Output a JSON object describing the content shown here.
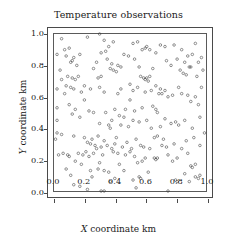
{
  "chart_data": {
    "type": "scatter",
    "title": "Temperature observations",
    "xlabel_var": "X",
    "xlabel_rest": " coordinate km",
    "ylabel_var": "Y",
    "ylabel_rest": " coordinate km",
    "xlim": [
      0.0,
      1.0
    ],
    "ylim": [
      0.0,
      1.0
    ],
    "grid": false,
    "legend": null,
    "marker": "open-circle",
    "marker_color": "#3a3a3a",
    "marker_size_px": 2.6,
    "xticks": [
      0.0,
      0.2,
      0.4,
      0.6,
      0.8,
      1.0
    ],
    "xticklabels": [
      "0.0",
      "0.2",
      "0.4",
      "0.6",
      "0.8",
      "1.0"
    ],
    "yticks": [
      0.0,
      0.2,
      0.4,
      0.6,
      0.8,
      1.0
    ],
    "yticklabels": [
      "0.0",
      "0.2",
      "0.4",
      "0.6",
      "0.8",
      "1.0"
    ],
    "n_points": 228,
    "points": [
      [
        0.3,
        1.0
      ],
      [
        0.05,
        0.97
      ],
      [
        0.22,
        0.98
      ],
      [
        0.33,
        0.96
      ],
      [
        0.39,
        0.95
      ],
      [
        0.52,
        0.94
      ],
      [
        0.55,
        0.95
      ],
      [
        0.93,
        0.94
      ],
      [
        0.1,
        0.91
      ],
      [
        0.36,
        0.92
      ],
      [
        0.61,
        0.92
      ],
      [
        0.7,
        0.93
      ],
      [
        0.73,
        0.92
      ],
      [
        0.79,
        0.93
      ],
      [
        0.84,
        0.9
      ],
      [
        0.07,
        0.9
      ],
      [
        0.02,
        0.87
      ],
      [
        0.08,
        0.86
      ],
      [
        0.13,
        0.85
      ],
      [
        0.17,
        0.87
      ],
      [
        0.31,
        0.88
      ],
      [
        0.34,
        0.89
      ],
      [
        0.46,
        0.87
      ],
      [
        0.58,
        0.9
      ],
      [
        0.6,
        0.91
      ],
      [
        0.63,
        0.9
      ],
      [
        0.67,
        0.88
      ],
      [
        0.88,
        0.86
      ],
      [
        0.91,
        0.87
      ],
      [
        0.97,
        0.85
      ],
      [
        0.49,
        0.86
      ],
      [
        0.53,
        0.84
      ],
      [
        0.12,
        0.83
      ],
      [
        0.11,
        0.82
      ],
      [
        0.15,
        0.8
      ],
      [
        0.28,
        0.82
      ],
      [
        0.35,
        0.84
      ],
      [
        0.38,
        0.81
      ],
      [
        0.42,
        0.8
      ],
      [
        0.74,
        0.83
      ],
      [
        0.81,
        0.84
      ],
      [
        0.86,
        0.82
      ],
      [
        0.95,
        0.82
      ],
      [
        0.04,
        0.77
      ],
      [
        0.26,
        0.78
      ],
      [
        0.37,
        0.78
      ],
      [
        0.39,
        0.77
      ],
      [
        0.41,
        0.76
      ],
      [
        0.44,
        0.79
      ],
      [
        0.56,
        0.79
      ],
      [
        0.65,
        0.78
      ],
      [
        0.77,
        0.8
      ],
      [
        0.83,
        0.77
      ],
      [
        0.89,
        0.79
      ],
      [
        0.9,
        0.79
      ],
      [
        0.98,
        0.77
      ],
      [
        0.09,
        0.73
      ],
      [
        0.12,
        0.72
      ],
      [
        0.14,
        0.71
      ],
      [
        0.16,
        0.73
      ],
      [
        0.29,
        0.72
      ],
      [
        0.31,
        0.73
      ],
      [
        0.57,
        0.73
      ],
      [
        0.59,
        0.72
      ],
      [
        0.6,
        0.71
      ],
      [
        0.61,
        0.72
      ],
      [
        0.62,
        0.7
      ],
      [
        0.63,
        0.73
      ],
      [
        0.85,
        0.75
      ],
      [
        0.87,
        0.74
      ],
      [
        0.94,
        0.73
      ],
      [
        0.05,
        0.71
      ],
      [
        0.02,
        0.65
      ],
      [
        0.08,
        0.67
      ],
      [
        0.11,
        0.66
      ],
      [
        0.13,
        0.65
      ],
      [
        0.2,
        0.67
      ],
      [
        0.24,
        0.65
      ],
      [
        0.3,
        0.66
      ],
      [
        0.5,
        0.68
      ],
      [
        0.52,
        0.64
      ],
      [
        0.55,
        0.66
      ],
      [
        0.67,
        0.67
      ],
      [
        0.7,
        0.65
      ],
      [
        0.73,
        0.64
      ],
      [
        0.82,
        0.66
      ],
      [
        0.97,
        0.66
      ],
      [
        0.44,
        0.65
      ],
      [
        0.07,
        0.62
      ],
      [
        0.18,
        0.63
      ],
      [
        0.33,
        0.63
      ],
      [
        0.42,
        0.62
      ],
      [
        0.6,
        0.63
      ],
      [
        0.64,
        0.64
      ],
      [
        0.69,
        0.62
      ],
      [
        0.71,
        0.62
      ],
      [
        0.75,
        0.6
      ],
      [
        0.78,
        0.61
      ],
      [
        0.84,
        0.62
      ],
      [
        0.88,
        0.61
      ],
      [
        0.93,
        0.6
      ],
      [
        0.02,
        0.53
      ],
      [
        0.1,
        0.55
      ],
      [
        0.14,
        0.52
      ],
      [
        0.23,
        0.51
      ],
      [
        0.26,
        0.5
      ],
      [
        0.4,
        0.52
      ],
      [
        0.47,
        0.52
      ],
      [
        0.53,
        0.51
      ],
      [
        0.58,
        0.53
      ],
      [
        0.65,
        0.54
      ],
      [
        0.67,
        0.52
      ],
      [
        0.68,
        0.5
      ],
      [
        0.9,
        0.57
      ],
      [
        0.95,
        0.55
      ],
      [
        0.12,
        0.49
      ],
      [
        0.17,
        0.47
      ],
      [
        0.34,
        0.5
      ],
      [
        0.43,
        0.48
      ],
      [
        0.46,
        0.47
      ],
      [
        0.52,
        0.45
      ],
      [
        0.56,
        0.44
      ],
      [
        0.61,
        0.45
      ],
      [
        0.73,
        0.46
      ],
      [
        0.8,
        0.44
      ],
      [
        0.86,
        0.45
      ],
      [
        0.96,
        0.47
      ],
      [
        0.38,
        0.45
      ],
      [
        0.3,
        0.43
      ],
      [
        0.36,
        0.42
      ],
      [
        0.37,
        0.4
      ],
      [
        0.44,
        0.42
      ],
      [
        0.49,
        0.41
      ],
      [
        0.64,
        0.4
      ],
      [
        0.7,
        0.41
      ],
      [
        0.77,
        0.43
      ],
      [
        0.82,
        0.42
      ],
      [
        0.91,
        0.4
      ],
      [
        0.02,
        0.37
      ],
      [
        0.05,
        0.36
      ],
      [
        0.99,
        0.37
      ],
      [
        0.13,
        0.35
      ],
      [
        0.2,
        0.34
      ],
      [
        0.25,
        0.33
      ],
      [
        0.01,
        0.33
      ],
      [
        0.29,
        0.35
      ],
      [
        0.33,
        0.32
      ],
      [
        0.41,
        0.34
      ],
      [
        0.48,
        0.31
      ],
      [
        0.54,
        0.33
      ],
      [
        0.66,
        0.34
      ],
      [
        0.68,
        0.35
      ],
      [
        0.72,
        0.33
      ],
      [
        0.87,
        0.32
      ],
      [
        0.92,
        0.34
      ],
      [
        0.22,
        0.31
      ],
      [
        0.24,
        0.3
      ],
      [
        0.27,
        0.29
      ],
      [
        0.28,
        0.27
      ],
      [
        0.31,
        0.28
      ],
      [
        0.35,
        0.29
      ],
      [
        0.38,
        0.27
      ],
      [
        0.4,
        0.3
      ],
      [
        0.45,
        0.28
      ],
      [
        0.51,
        0.27
      ],
      [
        0.57,
        0.29
      ],
      [
        0.59,
        0.28
      ],
      [
        0.63,
        0.27
      ],
      [
        0.71,
        0.29
      ],
      [
        0.74,
        0.28
      ],
      [
        0.79,
        0.3
      ],
      [
        0.84,
        0.27
      ],
      [
        0.96,
        0.29
      ],
      [
        0.06,
        0.24
      ],
      [
        0.09,
        0.23
      ],
      [
        0.1,
        0.22
      ],
      [
        0.16,
        0.24
      ],
      [
        0.19,
        0.23
      ],
      [
        0.21,
        0.25
      ],
      [
        0.23,
        0.22
      ],
      [
        0.26,
        0.24
      ],
      [
        0.32,
        0.23
      ],
      [
        0.39,
        0.25
      ],
      [
        0.42,
        0.24
      ],
      [
        0.47,
        0.23
      ],
      [
        0.5,
        0.25
      ],
      [
        0.53,
        0.22
      ],
      [
        0.6,
        0.21
      ],
      [
        0.66,
        0.21
      ],
      [
        0.67,
        0.2
      ],
      [
        0.68,
        0.21
      ],
      [
        0.75,
        0.23
      ],
      [
        0.81,
        0.21
      ],
      [
        0.88,
        0.24
      ],
      [
        0.03,
        0.23
      ],
      [
        0.14,
        0.19
      ],
      [
        0.18,
        0.17
      ],
      [
        0.3,
        0.18
      ],
      [
        0.43,
        0.17
      ],
      [
        0.55,
        0.18
      ],
      [
        0.58,
        0.19
      ],
      [
        0.78,
        0.19
      ],
      [
        0.9,
        0.16
      ],
      [
        0.91,
        0.15
      ],
      [
        0.93,
        0.17
      ],
      [
        0.08,
        0.14
      ],
      [
        0.24,
        0.13
      ],
      [
        0.29,
        0.14
      ],
      [
        0.33,
        0.13
      ],
      [
        0.36,
        0.12
      ],
      [
        0.46,
        0.13
      ],
      [
        0.62,
        0.12
      ],
      [
        0.86,
        0.11
      ],
      [
        0.11,
        0.1
      ],
      [
        0.25,
        0.09
      ],
      [
        0.4,
        0.08
      ],
      [
        0.52,
        0.07
      ],
      [
        0.56,
        0.09
      ],
      [
        0.57,
        0.08
      ],
      [
        0.8,
        0.07
      ],
      [
        0.81,
        0.06
      ],
      [
        0.93,
        0.09
      ],
      [
        0.95,
        0.08
      ],
      [
        0.96,
        0.1
      ],
      [
        0.89,
        0.06
      ],
      [
        0.13,
        0.04
      ],
      [
        0.17,
        0.03
      ],
      [
        0.22,
        0.01
      ],
      [
        0.37,
        0.06
      ],
      [
        0.54,
        0.02
      ],
      [
        0.31,
        0.0
      ],
      [
        0.33,
        0.0
      ],
      [
        0.75,
        0.0
      ],
      [
        0.02,
        0.45
      ],
      [
        0.2,
        0.58
      ],
      [
        0.5,
        0.58
      ]
    ]
  }
}
